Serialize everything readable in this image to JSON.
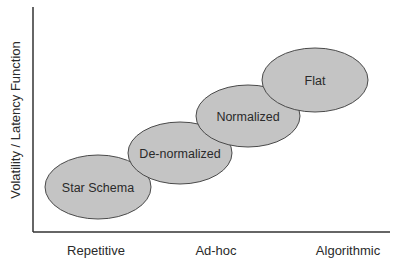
{
  "diagram": {
    "y_axis_label": "Volatility / Latency Function",
    "x_axis_labels": [
      "Repetitive",
      "Ad-hoc",
      "Algorithmic"
    ],
    "ellipses": [
      {
        "label": "Star Schema",
        "cx": 98,
        "cy": 187,
        "rx": 53,
        "ry": 32
      },
      {
        "label": "De-normalized",
        "cx": 180,
        "cy": 153,
        "rx": 52,
        "ry": 31
      },
      {
        "label": "Normalized",
        "cx": 248,
        "cy": 116,
        "rx": 52,
        "ry": 31
      },
      {
        "label": "Flat",
        "cx": 315,
        "cy": 80,
        "rx": 53,
        "ry": 32
      }
    ],
    "colors": {
      "ellipse_fill": "#c4c4c4",
      "ellipse_stroke": "#4a4a4a",
      "axis": "#333333",
      "text": "#2a2a2a"
    }
  }
}
